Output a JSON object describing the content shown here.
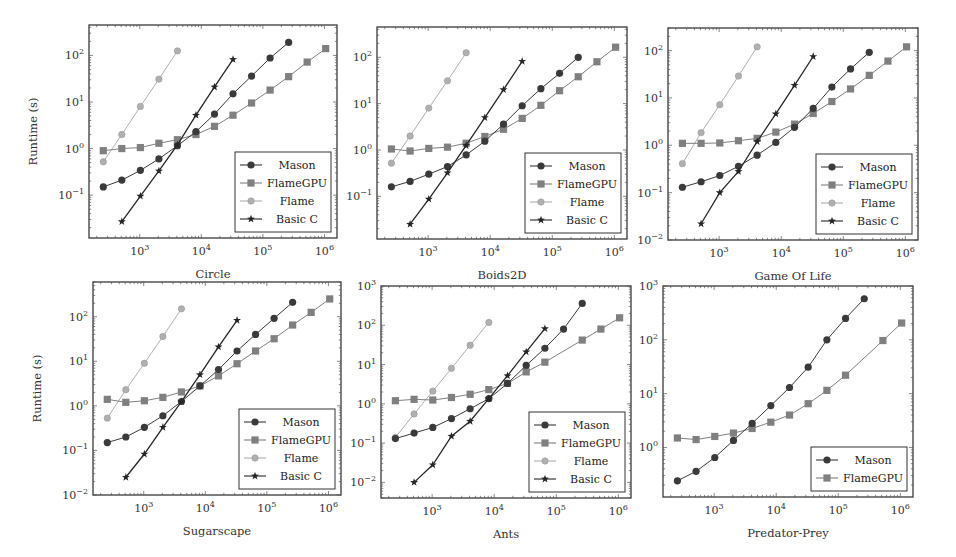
{
  "figure": {
    "x_values": [
      256,
      512,
      1024,
      2048,
      4096,
      8192,
      16384,
      32768,
      65536,
      131072,
      262144,
      524288,
      1048576
    ],
    "series_styles": {
      "Mason": {
        "color": "#3a3a3a",
        "marker": "circle"
      },
      "FlameGPU": {
        "color": "#808080",
        "marker": "square"
      },
      "Flame": {
        "color": "#b0b0b0",
        "marker": "circle-small"
      },
      "Basic C": {
        "color": "#262626",
        "marker": "star"
      }
    }
  },
  "chart_data": [
    {
      "type": "line",
      "title": "",
      "xlabel": "Circle",
      "ylabel": "Runtime (s)",
      "xscale": "log",
      "yscale": "log",
      "xlim": [
        150,
        1600000
      ],
      "ylim": [
        0.012,
        450
      ],
      "xticks": [
        "10^3",
        "10^4",
        "10^5",
        "10^6"
      ],
      "yticks": [
        "10^-1",
        "10^0",
        "10^1",
        "10^2"
      ],
      "legend": [
        "Mason",
        "FlameGPU",
        "Flame",
        "Basic C"
      ],
      "legend_position": "lower right",
      "frame": {
        "x0": 89,
        "y0": 25,
        "x1": 337,
        "y1": 238
      },
      "series": [
        {
          "name": "Mason",
          "x": [
            256,
            512,
            1024,
            2048,
            4096,
            8192,
            16384,
            32768,
            65536,
            131072,
            262144
          ],
          "values": [
            0.15,
            0.21,
            0.34,
            0.6,
            1.15,
            2.3,
            5.5,
            15,
            36,
            88,
            190
          ]
        },
        {
          "name": "FlameGPU",
          "x": [
            256,
            512,
            1024,
            2048,
            4096,
            8192,
            16384,
            32768,
            65536,
            131072,
            262144,
            524288,
            1048576
          ],
          "values": [
            0.9,
            1.0,
            1.05,
            1.3,
            1.55,
            2.0,
            3.0,
            5.2,
            9.5,
            18,
            35,
            72,
            140
          ]
        },
        {
          "name": "Flame",
          "x": [
            256,
            512,
            1024,
            2048,
            4096
          ],
          "values": [
            0.52,
            2.0,
            8.0,
            31,
            125
          ]
        },
        {
          "name": "Basic C",
          "x": [
            512,
            1024,
            2048,
            4096,
            8192,
            16384,
            32768
          ],
          "values": [
            0.027,
            0.095,
            0.33,
            1.2,
            5.2,
            21,
            82
          ]
        }
      ]
    },
    {
      "type": "line",
      "title": "",
      "xlabel": "Boids2D",
      "ylabel": "",
      "xscale": "log",
      "yscale": "log",
      "xlim": [
        150,
        1600000
      ],
      "ylim": [
        0.012,
        450
      ],
      "xticks": [
        "10^3",
        "10^4",
        "10^5",
        "10^6"
      ],
      "yticks": [
        "10^-1",
        "10^0",
        "10^1",
        "10^2"
      ],
      "legend": [
        "Mason",
        "FlameGPU",
        "Flame",
        "Basic C"
      ],
      "legend_position": "lower right",
      "frame": {
        "x0": 377,
        "y0": 27,
        "x1": 627,
        "y1": 239
      },
      "series": [
        {
          "name": "Mason",
          "x": [
            256,
            512,
            1024,
            2048,
            4096,
            8192,
            16384,
            32768,
            65536,
            131072,
            262144
          ],
          "values": [
            0.16,
            0.21,
            0.3,
            0.44,
            0.78,
            1.55,
            3.6,
            9,
            21,
            45,
            100
          ]
        },
        {
          "name": "FlameGPU",
          "x": [
            256,
            512,
            1024,
            2048,
            4096,
            8192,
            16384,
            32768,
            65536,
            131072,
            262144,
            524288,
            1048576
          ],
          "values": [
            1.05,
            0.95,
            1.08,
            1.15,
            1.4,
            1.95,
            2.8,
            4.8,
            9.2,
            19,
            38,
            80,
            165
          ]
        },
        {
          "name": "Flame",
          "x": [
            256,
            512,
            1024,
            2048,
            4096
          ],
          "values": [
            0.52,
            2.0,
            8.0,
            31,
            125
          ]
        },
        {
          "name": "Basic C",
          "x": [
            512,
            1024,
            2048,
            4096,
            8192,
            16384,
            32768
          ],
          "values": [
            0.025,
            0.087,
            0.32,
            1.25,
            5.0,
            20,
            82
          ]
        }
      ]
    },
    {
      "type": "line",
      "title": "",
      "xlabel": "Game Of Life",
      "ylabel": "",
      "xscale": "log",
      "yscale": "log",
      "xlim": [
        150,
        1600000
      ],
      "ylim": [
        0.01,
        300
      ],
      "xticks": [
        "10^3",
        "10^4",
        "10^5",
        "10^6"
      ],
      "yticks": [
        "10^-2",
        "10^-1",
        "10^0",
        "10^1",
        "10^2"
      ],
      "legend": [
        "Mason",
        "FlameGPU",
        "Flame",
        "Basic C"
      ],
      "legend_position": "lower right",
      "frame": {
        "x0": 668,
        "y0": 28,
        "x1": 918,
        "y1": 240
      },
      "series": [
        {
          "name": "Mason",
          "x": [
            256,
            512,
            1024,
            2048,
            4096,
            8192,
            16384,
            32768,
            65536,
            131072,
            262144
          ],
          "values": [
            0.13,
            0.17,
            0.23,
            0.36,
            0.62,
            1.15,
            2.4,
            6.0,
            17,
            41,
            92
          ]
        },
        {
          "name": "FlameGPU",
          "x": [
            256,
            512,
            1024,
            2048,
            4096,
            8192,
            16384,
            32768,
            65536,
            131072,
            262144,
            524288,
            1048576
          ],
          "values": [
            1.1,
            1.1,
            1.12,
            1.25,
            1.4,
            1.9,
            2.8,
            4.7,
            8.4,
            15.5,
            30,
            60,
            120
          ]
        },
        {
          "name": "Flame",
          "x": [
            256,
            512,
            1024,
            2048,
            4096
          ],
          "values": [
            0.41,
            1.85,
            7.2,
            29,
            120
          ]
        },
        {
          "name": "Basic C",
          "x": [
            512,
            1024,
            2048,
            4096,
            8192,
            16384,
            32768
          ],
          "values": [
            0.022,
            0.1,
            0.28,
            1.2,
            4.6,
            18.5,
            75
          ]
        }
      ]
    },
    {
      "type": "line",
      "title": "",
      "xlabel": "Sugarscape",
      "ylabel": "Runtime (s)",
      "xscale": "log",
      "yscale": "log",
      "xlim": [
        150,
        1600000
      ],
      "ylim": [
        0.01,
        600
      ],
      "xticks": [
        "10^3",
        "10^4",
        "10^5",
        "10^6"
      ],
      "yticks": [
        "10^-2",
        "10^-1",
        "10^0",
        "10^1",
        "10^2"
      ],
      "legend": [
        "Mason",
        "FlameGPU",
        "Flame",
        "Basic C"
      ],
      "legend_position": "lower right",
      "frame": {
        "x0": 93,
        "y0": 282,
        "x1": 341,
        "y1": 495
      },
      "series": [
        {
          "name": "Mason",
          "x": [
            256,
            512,
            1024,
            2048,
            4096,
            8192,
            16384,
            32768,
            65536,
            131072,
            262144
          ],
          "values": [
            0.15,
            0.2,
            0.33,
            0.6,
            1.25,
            2.8,
            6.5,
            17,
            40,
            92,
            210
          ]
        },
        {
          "name": "FlameGPU",
          "x": [
            256,
            512,
            1024,
            2048,
            4096,
            8192,
            16384,
            32768,
            65536,
            131072,
            262144,
            524288,
            1048576
          ],
          "values": [
            1.4,
            1.2,
            1.3,
            1.55,
            2.05,
            2.8,
            4.7,
            8.8,
            17,
            32,
            65,
            125,
            250
          ]
        },
        {
          "name": "Flame",
          "x": [
            256,
            512,
            1024,
            2048,
            4096
          ],
          "values": [
            0.53,
            2.3,
            9.0,
            36,
            150
          ]
        },
        {
          "name": "Basic C",
          "x": [
            512,
            1024,
            2048,
            4096,
            8192,
            16384,
            32768
          ],
          "values": [
            0.025,
            0.083,
            0.33,
            1.25,
            5.0,
            21,
            83
          ]
        }
      ]
    },
    {
      "type": "line",
      "title": "",
      "xlabel": "Ants",
      "ylabel": "",
      "xscale": "log",
      "yscale": "log",
      "xlim": [
        150,
        1600000
      ],
      "ylim": [
        0.004,
        1000
      ],
      "xticks": [
        "10^3",
        "10^4",
        "10^5",
        "10^6"
      ],
      "yticks": [
        "10^-2",
        "10^-1",
        "10^0",
        "10^1",
        "10^2",
        "10^3"
      ],
      "legend": [
        "Mason",
        "FlameGPU",
        "Flame",
        "Basic C"
      ],
      "legend_position": "lower right",
      "frame": {
        "x0": 381,
        "y0": 286,
        "x1": 631,
        "y1": 498
      },
      "series": [
        {
          "name": "Mason",
          "x": [
            256,
            512,
            1024,
            2048,
            4096,
            8192,
            16384,
            32768,
            65536,
            131072,
            262144
          ],
          "values": [
            0.13,
            0.18,
            0.25,
            0.42,
            0.75,
            1.35,
            3.3,
            9.5,
            26,
            80,
            360
          ]
        },
        {
          "name": "FlameGPU",
          "x": [
            256,
            512,
            1024,
            2048,
            4096,
            8192,
            16384,
            32768,
            65536,
            262144,
            524288,
            1048576
          ],
          "values": [
            1.2,
            1.3,
            1.25,
            1.45,
            1.75,
            2.3,
            3.3,
            6.5,
            11.5,
            42,
            80,
            155
          ]
        },
        {
          "name": "Flame",
          "x": [
            256,
            512,
            1024,
            2048,
            4096,
            8192
          ],
          "values": [
            0.14,
            0.55,
            2.1,
            8.0,
            31,
            118
          ]
        },
        {
          "name": "Basic C",
          "x": [
            512,
            1024,
            2048,
            4096,
            8192,
            16384,
            32768,
            65536
          ],
          "values": [
            0.01,
            0.028,
            0.15,
            0.36,
            1.35,
            5.2,
            21,
            82
          ]
        }
      ]
    },
    {
      "type": "line",
      "title": "",
      "xlabel": "Predator-Prey",
      "ylabel": "",
      "xscale": "log",
      "yscale": "log",
      "xlim": [
        150,
        1600000
      ],
      "ylim": [
        0.12,
        1000
      ],
      "xticks": [
        "10^3",
        "10^4",
        "10^5",
        "10^6"
      ],
      "yticks": [
        "10^0",
        "10^1",
        "10^2",
        "10^3"
      ],
      "legend": [
        "Mason",
        "FlameGPU"
      ],
      "legend_position": "lower right",
      "frame": {
        "x0": 663,
        "y0": 286,
        "x1": 913,
        "y1": 497
      },
      "series": [
        {
          "name": "Mason",
          "x": [
            256,
            512,
            1024,
            2048,
            4096,
            8192,
            16384,
            32768,
            65536,
            131072,
            262144
          ],
          "values": [
            0.24,
            0.36,
            0.65,
            1.35,
            2.8,
            6.0,
            13,
            31,
            100,
            250,
            580
          ]
        },
        {
          "name": "FlameGPU",
          "x": [
            256,
            512,
            1024,
            2048,
            4096,
            8192,
            16384,
            32768,
            65536,
            131072,
            524288,
            1048576
          ],
          "values": [
            1.5,
            1.4,
            1.6,
            1.85,
            2.25,
            2.95,
            4.0,
            6.5,
            11.5,
            22,
            97,
            205
          ]
        }
      ]
    }
  ]
}
